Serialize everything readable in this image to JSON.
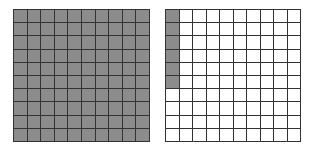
{
  "diagram": {
    "type": "hundred-grids",
    "rows": 10,
    "cols": 10,
    "fill_color": "#8c8c8c",
    "empty_color": "#ffffff",
    "line_color": "#333333",
    "grids": [
      {
        "name": "left-grid",
        "left": 13,
        "top": 9,
        "width": 137,
        "height": 133,
        "shaded_cells": 100,
        "shaded_pattern": "all"
      },
      {
        "name": "right-grid",
        "left": 165,
        "top": 9,
        "width": 136,
        "height": 133,
        "shaded_cells": 6,
        "shaded_pattern": "first-column-top-6"
      }
    ]
  }
}
